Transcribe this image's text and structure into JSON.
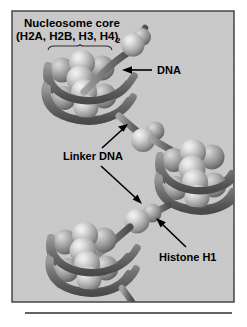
{
  "figure": {
    "title_line1": "Nucleosome core",
    "title_line2": "(H2A, H2B, H3, H4)",
    "title_subscript": "2",
    "labels": {
      "dna": "DNA",
      "linker_dna": "Linker DNA",
      "histone_h1": "Histone H1"
    },
    "colors": {
      "panel_background": "#c9c9c9",
      "panel_border": "#3a3a3a",
      "sphere_highlight": "#f0f0f0",
      "sphere_mid": "#b4b4b4",
      "sphere_shadow": "#6e6e6e",
      "dna_ribbon": "#5d5d5d",
      "dna_ribbon_light": "#8e8e8e",
      "text": "#000000",
      "rule": "#2e2e2e",
      "page_background": "#ffffff"
    },
    "panel": {
      "x": 12,
      "y": 11,
      "width": 222,
      "height": 291
    },
    "rule": {
      "x1": 25,
      "x2": 232,
      "y": 313
    },
    "structure": {
      "type": "beads-on-a-string chromatin fiber",
      "nucleosome_count": 3,
      "linker_histone_count": 3,
      "histones_per_core": 8,
      "core_composition": "(H2A, H2B, H3, H4)2"
    }
  }
}
